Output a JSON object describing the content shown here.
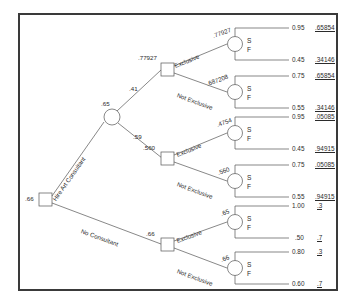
{
  "diagram": {
    "type": "decision-tree",
    "root": {
      "value": ".66",
      "node_type": "decision"
    },
    "branch_labels": {
      "hire": "Hire Art Consultant",
      "no_hire": "No Consultant",
      "exclusive": "Exclusive",
      "not_exclusive": "Not Exclusive"
    },
    "outcome_labels": {
      "success": "S",
      "failure": "F"
    },
    "chance_probs": {
      "upper": ".41",
      "lower": ".59"
    },
    "nodes": {
      "chance_after_hire": ".65",
      "decision_upper": ".77927",
      "decision_middle": ".560",
      "decision_lower": ".66",
      "chance_1": ".77927",
      "chance_2": ".687208",
      "chance_3": ".4754",
      "chance_4": ".560",
      "chance_5": ".65",
      "chance_6": ".66"
    },
    "endpoints": [
      {
        "id": "e1",
        "prob": "0.95",
        "payoff": ".65854",
        "outcome": "S"
      },
      {
        "id": "e2",
        "prob": "0.45",
        "payoff": ".34146",
        "outcome": "F"
      },
      {
        "id": "e3",
        "prob": "0.75",
        "payoff": ".65854",
        "outcome": "S"
      },
      {
        "id": "e4",
        "prob": "0.55",
        "payoff": ".34146",
        "outcome": "F"
      },
      {
        "id": "e5",
        "prob": "0.95",
        "payoff": ".05085",
        "outcome": "S"
      },
      {
        "id": "e6",
        "prob": "0.45",
        "payoff": ".94915",
        "outcome": "F"
      },
      {
        "id": "e7",
        "prob": "0.75",
        "payoff": ".05085",
        "outcome": "S"
      },
      {
        "id": "e8",
        "prob": "0.55",
        "payoff": ".94915",
        "outcome": "F"
      },
      {
        "id": "e9",
        "prob": "1.00",
        "payoff": ".3",
        "outcome": "S"
      },
      {
        "id": "e10",
        "prob": ".50",
        "payoff": ".7",
        "outcome": "F"
      },
      {
        "id": "e11",
        "prob": "0.80",
        "payoff": ".3",
        "outcome": "S"
      },
      {
        "id": "e12",
        "prob": "0.60",
        "payoff": ".7",
        "outcome": "F"
      }
    ],
    "colors": {
      "line": "#555555",
      "text": "#2b2b2b",
      "border": "#3a3a3a",
      "background": "#ffffff"
    }
  }
}
